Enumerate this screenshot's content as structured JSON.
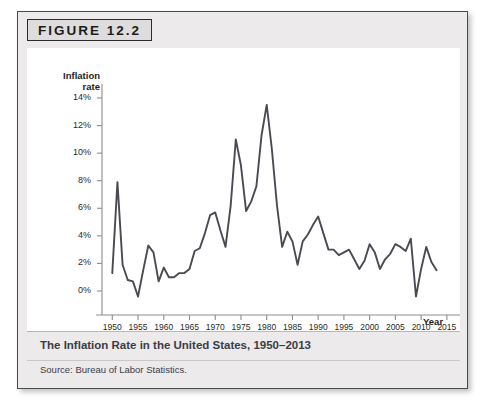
{
  "figure": {
    "label": "FIGURE 12.2",
    "caption": "The Inflation Rate in the United States, 1950–2013",
    "source": "Source: Bureau of Labor Statistics."
  },
  "colors": {
    "line": "#4a4a52",
    "axis": "#8d8d8d",
    "panel_bg": "#ffffff",
    "card_bg": "#eceaea",
    "card_border": "#4a4a4a",
    "caption_text": "#3c3c46",
    "label_box_bg": "#dedcdc"
  },
  "chart_data": {
    "type": "line",
    "title": "The Inflation Rate in the United States, 1950–2013",
    "xlabel": "Year",
    "ylabel": "Inflation rate",
    "ylabel_lines": [
      "Inflation",
      "rate"
    ],
    "xlim": [
      1948,
      2016
    ],
    "ylim": [
      -1.5,
      15
    ],
    "grid": false,
    "legend": "none",
    "y_ticks": [
      0,
      2,
      4,
      6,
      8,
      10,
      12,
      14
    ],
    "y_tick_labels": [
      "0%",
      "2%",
      "4%",
      "6%",
      "8%",
      "10%",
      "12%",
      "14%"
    ],
    "x_ticks": [
      1950,
      1955,
      1960,
      1965,
      1970,
      1975,
      1980,
      1985,
      1990,
      1995,
      2000,
      2005,
      2010,
      2015
    ],
    "x_tick_labels": [
      "1950",
      "1955",
      "1960",
      "1965",
      "1970",
      "1975",
      "1980",
      "1985",
      "1990",
      "1995",
      "2000",
      "2005",
      "2010",
      "2015"
    ],
    "series": [
      {
        "name": "Inflation rate",
        "x": [
          1950,
          1951,
          1952,
          1953,
          1954,
          1955,
          1956,
          1957,
          1958,
          1959,
          1960,
          1961,
          1962,
          1963,
          1964,
          1965,
          1966,
          1967,
          1968,
          1969,
          1970,
          1971,
          1972,
          1973,
          1974,
          1975,
          1976,
          1977,
          1978,
          1979,
          1980,
          1981,
          1982,
          1983,
          1984,
          1985,
          1986,
          1987,
          1988,
          1989,
          1990,
          1991,
          1992,
          1993,
          1994,
          1995,
          1996,
          1997,
          1998,
          1999,
          2000,
          2001,
          2002,
          2003,
          2004,
          2005,
          2006,
          2007,
          2008,
          2009,
          2010,
          2011,
          2012,
          2013
        ],
        "values": [
          1.3,
          7.9,
          1.9,
          0.8,
          0.7,
          -0.4,
          1.5,
          3.3,
          2.8,
          0.7,
          1.7,
          1.0,
          1.0,
          1.3,
          1.3,
          1.6,
          2.9,
          3.1,
          4.2,
          5.5,
          5.7,
          4.4,
          3.2,
          6.2,
          11.0,
          9.1,
          5.8,
          6.5,
          7.6,
          11.3,
          13.5,
          10.3,
          6.2,
          3.2,
          4.3,
          3.6,
          1.9,
          3.6,
          4.1,
          4.8,
          5.4,
          4.2,
          3.0,
          3.0,
          2.6,
          2.8,
          3.0,
          2.3,
          1.6,
          2.2,
          3.4,
          2.8,
          1.6,
          2.3,
          2.7,
          3.4,
          3.2,
          2.9,
          3.8,
          -0.4,
          1.6,
          3.2,
          2.1,
          1.5
        ]
      }
    ]
  }
}
